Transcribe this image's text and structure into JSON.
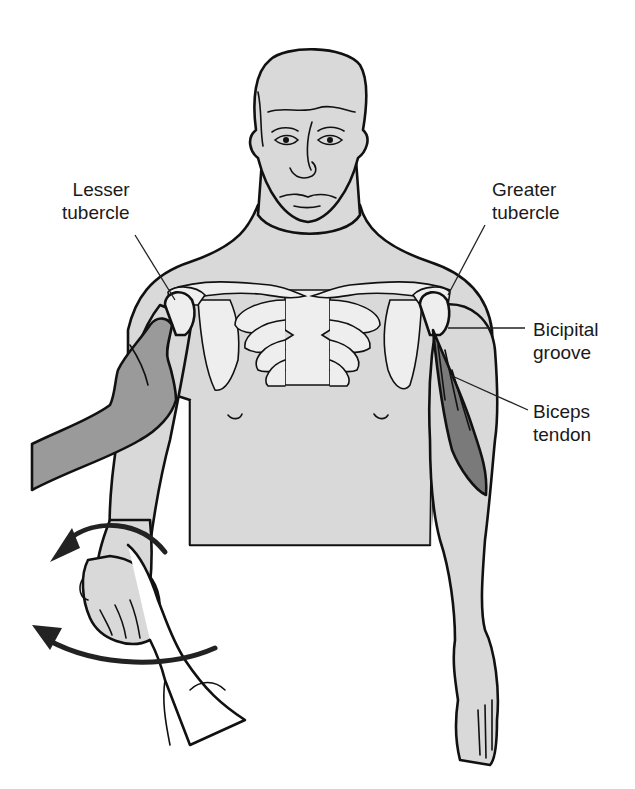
{
  "figure": {
    "colors": {
      "background": "#ffffff",
      "skin": "#d9d9d9",
      "bone": "#eeeeee",
      "examiner_hand": "#9a9a9a",
      "muscle": "#7a7a7a",
      "outline": "#111111",
      "arrow": "#222222"
    }
  },
  "labels": {
    "lesser_tubercle": {
      "line1": "Lesser",
      "line2": "tubercle"
    },
    "greater_tubercle": {
      "line1": "Greater",
      "line2": "tubercle"
    },
    "bicipital_groove": {
      "line1": "Bicipital",
      "line2": "groove"
    },
    "biceps_tendon": {
      "line1": "Biceps",
      "line2": "tendon"
    }
  },
  "annotations": {
    "arrows": [
      {
        "name": "rotation-arrow-wrist",
        "direction": "counter-clockwise (leftward)"
      },
      {
        "name": "rotation-arrow-forearm",
        "direction": "leftward"
      }
    ]
  }
}
